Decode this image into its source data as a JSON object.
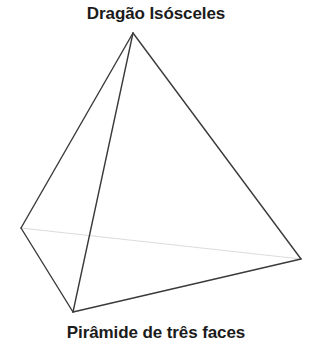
{
  "canvas": {
    "width": 312,
    "height": 346,
    "background": "#ffffff"
  },
  "labels": {
    "top": "Dragão Isósceles",
    "bottom": "Pirâmide de três faces"
  },
  "figure": {
    "name": "tetrahedron",
    "colors": {
      "visible_edge": "#3a3a3a",
      "hidden_edge": "#dcdcdc",
      "face_fill": "none",
      "text": "#1b1b1b"
    },
    "stroke_widths": {
      "visible_edge": 1.4,
      "hidden_edge": 1.2
    },
    "vertices": [
      {
        "id": "apex",
        "label": "A",
        "x": 133,
        "y": 33
      },
      {
        "id": "left",
        "label": "B",
        "x": 21,
        "y": 228
      },
      {
        "id": "bottom",
        "label": "C",
        "x": 73,
        "y": 312
      },
      {
        "id": "right",
        "label": "D",
        "x": 301,
        "y": 259
      }
    ],
    "edges": [
      {
        "from": "apex",
        "to": "left",
        "hidden": false
      },
      {
        "from": "apex",
        "to": "bottom",
        "hidden": false
      },
      {
        "from": "apex",
        "to": "right",
        "hidden": false
      },
      {
        "from": "left",
        "to": "bottom",
        "hidden": false
      },
      {
        "from": "bottom",
        "to": "right",
        "hidden": false
      },
      {
        "from": "left",
        "to": "right",
        "hidden": true
      }
    ]
  }
}
